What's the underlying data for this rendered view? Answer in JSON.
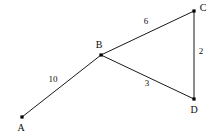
{
  "diagram": {
    "type": "weighted-undirected-graph",
    "background_color": "#ffffff",
    "stroke_color": "#1a1a1a",
    "text_color": "#0d0d0d",
    "canvas": {
      "width": 213,
      "height": 138
    },
    "nodes": [
      {
        "id": "A",
        "label": "A",
        "x": 22,
        "y": 117,
        "label_x": 21,
        "label_y": 129
      },
      {
        "id": "B",
        "label": "B",
        "x": 101,
        "y": 55,
        "label_x": 99,
        "label_y": 46
      },
      {
        "id": "C",
        "label": "C",
        "x": 194,
        "y": 11,
        "label_x": 203,
        "label_y": 9
      },
      {
        "id": "D",
        "label": "D",
        "x": 194,
        "y": 99,
        "label_x": 194,
        "label_y": 111
      }
    ],
    "edges": [
      {
        "id": "AB",
        "from": "A",
        "to": "B",
        "weight": "10",
        "label_x": 53,
        "label_y": 80
      },
      {
        "id": "BC",
        "from": "B",
        "to": "C",
        "weight": "6",
        "label_x": 146,
        "label_y": 22
      },
      {
        "id": "BD",
        "from": "B",
        "to": "D",
        "weight": "3",
        "label_x": 147,
        "label_y": 84
      },
      {
        "id": "CD",
        "from": "C",
        "to": "D",
        "weight": "2",
        "label_x": 201,
        "label_y": 52
      }
    ]
  }
}
